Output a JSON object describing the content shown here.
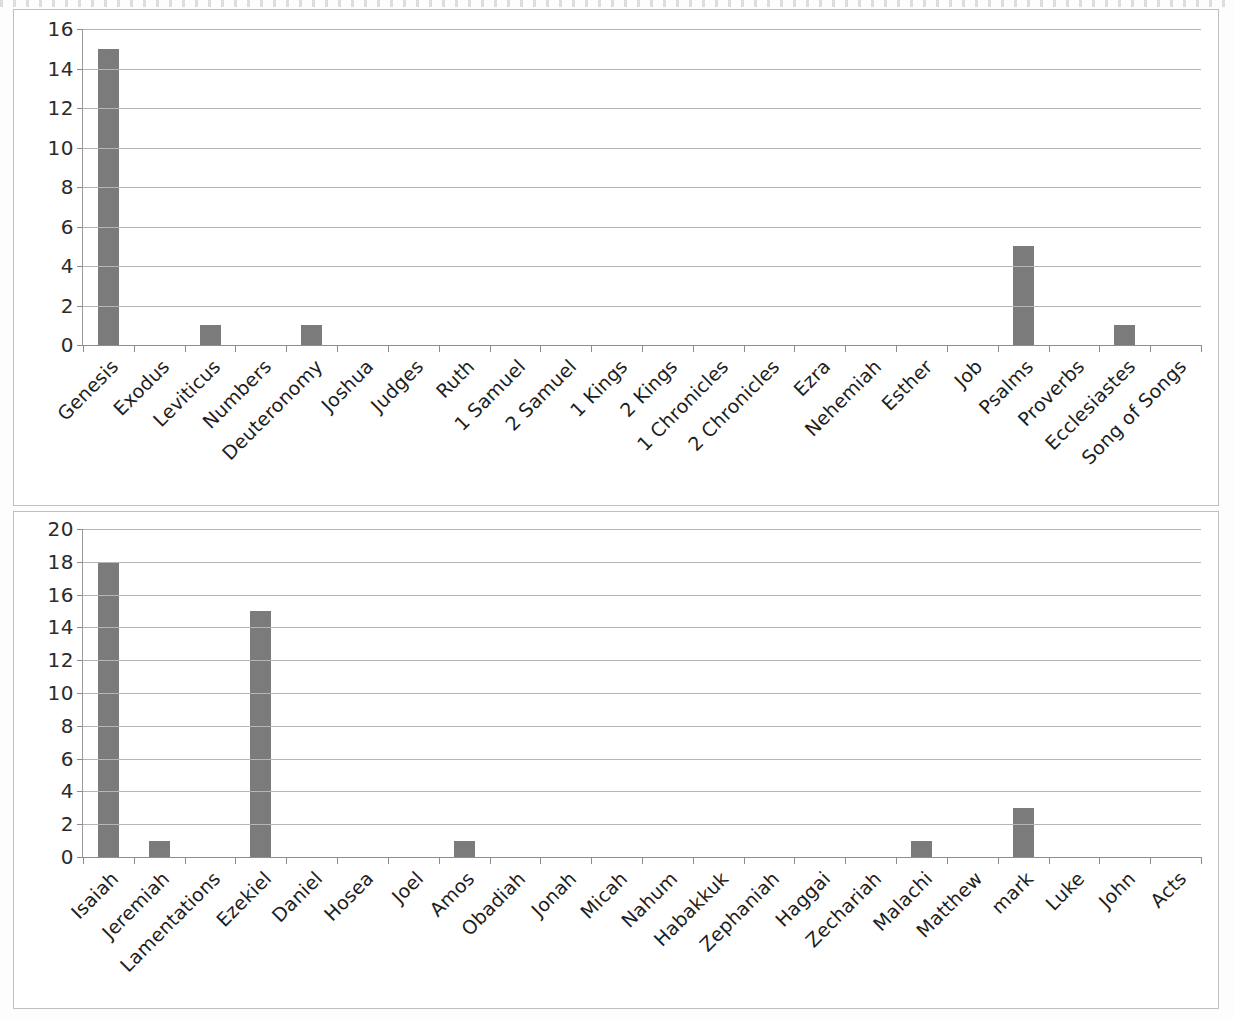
{
  "document": {
    "type": "scanned-document",
    "page_background": "#fdfdfd",
    "panel_border_color": "#bfbfbf"
  },
  "chart_data": [
    {
      "id": "chart-old-testament-part1",
      "type": "bar",
      "title": "",
      "xlabel": "",
      "ylabel": "",
      "ylim": [
        0,
        16
      ],
      "ytick_step": 2,
      "yticks": [
        0,
        2,
        4,
        6,
        8,
        10,
        12,
        14,
        16
      ],
      "ytick_labels": [
        "0",
        "2",
        "4",
        "6",
        "8",
        "10",
        "12",
        "14",
        "16"
      ],
      "grid": true,
      "legend": "none",
      "bar_color": "#7b7b7b",
      "categories": [
        "Genesis",
        "Exodus",
        "Leviticus",
        "Numbers",
        "Deuteronomy",
        "Joshua",
        "Judges",
        "Ruth",
        "1 Samuel",
        "2 Samuel",
        "1 Kings",
        "2 Kings",
        "1 Chronicles",
        "2 Chronicles",
        "Ezra",
        "Nehemiah",
        "Esther",
        "Job",
        "Psalms",
        "Proverbs",
        "Ecclesiastes",
        "Song of Songs"
      ],
      "values": [
        15,
        0,
        1,
        0,
        1,
        0,
        0,
        0,
        0,
        0,
        0,
        0,
        0,
        0,
        0,
        0,
        0,
        0,
        5,
        0,
        1,
        0
      ]
    },
    {
      "id": "chart-old-testament-part2-and-new-testament",
      "type": "bar",
      "title": "",
      "xlabel": "",
      "ylabel": "",
      "ylim": [
        0,
        20
      ],
      "ytick_step": 2,
      "yticks": [
        0,
        2,
        4,
        6,
        8,
        10,
        12,
        14,
        16,
        18,
        20
      ],
      "ytick_labels": [
        "0",
        "2",
        "4",
        "6",
        "8",
        "10",
        "12",
        "14",
        "16",
        "18",
        "20"
      ],
      "grid": true,
      "legend": "none",
      "bar_color": "#7b7b7b",
      "categories": [
        "Isaiah",
        "Jeremiah",
        "Lamentations",
        "Ezekiel",
        "Daniel",
        "Hosea",
        "Joel",
        "Amos",
        "Obadiah",
        "Jonah",
        "Micah",
        "Nahum",
        "Habakkuk",
        "Zephaniah",
        "Haggai",
        "Zechariah",
        "Malachi",
        "Matthew",
        "mark",
        "Luke",
        "John",
        "Acts"
      ],
      "values": [
        18,
        1,
        0,
        15,
        0,
        0,
        0,
        1,
        0,
        0,
        0,
        0,
        0,
        0,
        0,
        0,
        1,
        0,
        3,
        0,
        0,
        0
      ]
    }
  ]
}
